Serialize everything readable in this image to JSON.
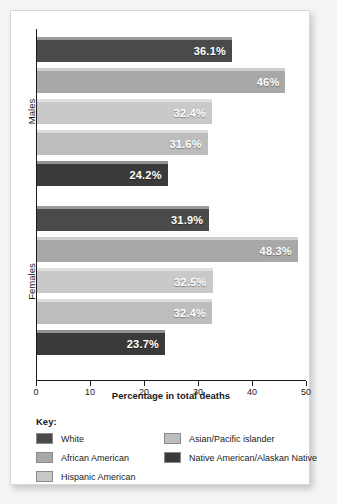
{
  "chart_data": {
    "type": "bar",
    "orientation": "horizontal",
    "title": "",
    "xlabel": "Percentage in total deaths",
    "ylabel": "",
    "xlim": [
      0,
      50
    ],
    "xticks": [
      0,
      10,
      20,
      30,
      40,
      50
    ],
    "xticklabels": [
      "0",
      "10",
      "20",
      "30",
      "40",
      "50"
    ],
    "grid": false,
    "legend_position": "bottom-left",
    "groups": [
      {
        "label": "Males",
        "bars": [
          {
            "category": "White",
            "value": 36.1,
            "value_label": "36.1%",
            "color": "#4a4a4a"
          },
          {
            "category": "African American",
            "value": 46.0,
            "value_label": "46%",
            "color": "#a8a8a8"
          },
          {
            "category": "Hispanic American",
            "value": 32.4,
            "value_label": "32.4%",
            "color": "#c9c9c9"
          },
          {
            "category": "Asian/Pacific islander",
            "value": 31.6,
            "value_label": "31.6%",
            "color": "#bdbdbd"
          },
          {
            "category": "Native American/Alaskan Native",
            "value": 24.2,
            "value_label": "24.2%",
            "color": "#3a3a3a"
          }
        ]
      },
      {
        "label": "Females",
        "bars": [
          {
            "category": "White",
            "value": 31.9,
            "value_label": "31.9%",
            "color": "#4a4a4a"
          },
          {
            "category": "African American",
            "value": 48.3,
            "value_label": "48.3%",
            "color": "#a8a8a8"
          },
          {
            "category": "Hispanic American",
            "value": 32.5,
            "value_label": "32.5%",
            "color": "#c9c9c9"
          },
          {
            "category": "Asian/Pacific islander",
            "value": 32.4,
            "value_label": "32.4%",
            "color": "#bdbdbd"
          },
          {
            "category": "Native American/Alaskan Native",
            "value": 23.7,
            "value_label": "23.7%",
            "color": "#3a3a3a"
          }
        ]
      }
    ],
    "series": [
      {
        "name": "White",
        "categories": [
          "Males",
          "Females"
        ],
        "values": [
          36.1,
          31.9
        ]
      },
      {
        "name": "African American",
        "categories": [
          "Males",
          "Females"
        ],
        "values": [
          46.0,
          48.3
        ]
      },
      {
        "name": "Hispanic American",
        "categories": [
          "Males",
          "Females"
        ],
        "values": [
          32.4,
          32.5
        ]
      },
      {
        "name": "Asian/Pacific islander",
        "categories": [
          "Males",
          "Females"
        ],
        "values": [
          31.6,
          32.4
        ]
      },
      {
        "name": "Native American/Alaskan Native",
        "categories": [
          "Males",
          "Females"
        ],
        "values": [
          24.2,
          23.7
        ]
      }
    ]
  },
  "legend": {
    "title": "Key:",
    "items": [
      {
        "label": "White",
        "color": "#4a4a4a",
        "col": 0,
        "row": 0
      },
      {
        "label": "African American",
        "color": "#a8a8a8",
        "col": 0,
        "row": 1
      },
      {
        "label": "Hispanic American",
        "color": "#c9c9c9",
        "col": 0,
        "row": 2
      },
      {
        "label": "Asian/Pacific islander",
        "color": "#bdbdbd",
        "col": 1,
        "row": 0
      },
      {
        "label": "Native American/Alaskan Native",
        "color": "#3a3a3a",
        "col": 1,
        "row": 1
      }
    ]
  },
  "colors": {
    "axis": "#1a1a1a",
    "card_background": "#ffffff",
    "page_background": "#f4f4f4",
    "value_label_text": "#ffffff"
  }
}
